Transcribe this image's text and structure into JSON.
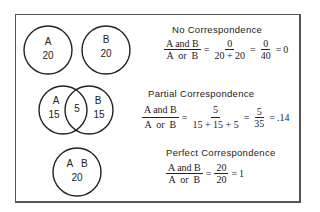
{
  "panels": [
    {
      "title": "No Correspondence",
      "circles": [
        {
          "label": "A",
          "value": "20"
        },
        {
          "label": "B",
          "value": "20"
        }
      ],
      "equation": {
        "lhs_num": "A and B",
        "lhs_den": "A  or  B",
        "f1_num": "0",
        "f1_den": "20 + 20",
        "f2_num": "0",
        "f2_den": "40",
        "result": "0"
      }
    },
    {
      "title": "Partial Correspondence",
      "circles": [
        {
          "label": "A",
          "value": "15"
        },
        {
          "label": "B",
          "value": "15"
        }
      ],
      "overlap": "5",
      "equation": {
        "lhs_num": "A and B",
        "lhs_den": "A  or  B",
        "f1_num": "5",
        "f1_den": "15 + 15 + 5",
        "f2_num": "5",
        "f2_den": "35",
        "result": ".14"
      }
    },
    {
      "title": "Perfect Correspondence",
      "circles": [
        {
          "label": "A   B",
          "value": "20"
        }
      ],
      "equation": {
        "lhs_num": "A and B",
        "lhs_den": "A  or  B",
        "f1_num": "20",
        "f1_den": "20",
        "result": "1"
      }
    }
  ],
  "symbols": {
    "eq": "="
  }
}
